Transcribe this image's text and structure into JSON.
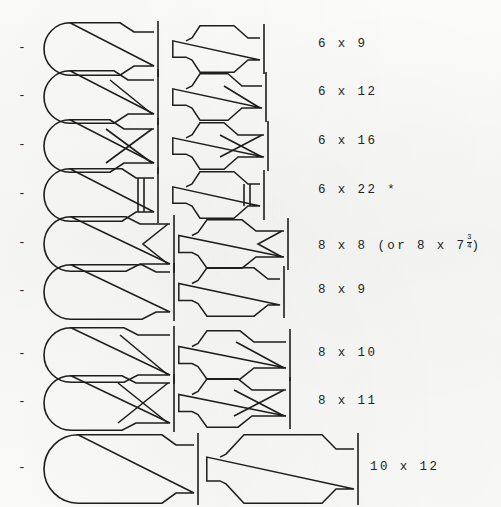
{
  "page": {
    "bullet_glyph": "-",
    "background_color": "#fbfbfa",
    "ink_color": "#1e1e1e"
  },
  "columns": {
    "bullet_label": "bullet",
    "profile_label": "large-profile",
    "section_label": "small-profile",
    "size_label": "size"
  },
  "rows": [
    {
      "id": "row-6x9",
      "bullet": "-",
      "size_text": "6 x 9",
      "size_has_fraction": false,
      "asterisk": false,
      "marking": "none",
      "stop_bars": 1,
      "y": 20,
      "label_x": 318,
      "label_y": 37,
      "large": {
        "x": 44,
        "w": 112,
        "h": 54,
        "body_w": 86,
        "round_r": 26,
        "tail_h": 34
      },
      "small": {
        "x": 172,
        "w": 90,
        "h": 48,
        "body_w": 72,
        "round_r": 20,
        "tail_h": 22
      }
    },
    {
      "id": "row-6x12",
      "bullet": "-",
      "size_text": "6 x 12",
      "size_has_fraction": false,
      "asterisk": false,
      "marking": "diagonal",
      "stop_bars": 1,
      "y": 68,
      "label_x": 318,
      "label_y": 85,
      "large": {
        "x": 44,
        "w": 112,
        "h": 54,
        "body_w": 80,
        "round_r": 26,
        "tail_h": 34
      },
      "small": {
        "x": 172,
        "w": 92,
        "h": 48,
        "body_w": 66,
        "round_r": 20,
        "tail_h": 22
      }
    },
    {
      "id": "row-6x16",
      "bullet": "-",
      "size_text": "6 x 16",
      "size_has_fraction": false,
      "asterisk": false,
      "marking": "cross",
      "stop_bars": 1,
      "y": 117,
      "label_x": 318,
      "label_y": 134,
      "large": {
        "x": 44,
        "w": 112,
        "h": 54,
        "body_w": 76,
        "round_r": 26,
        "tail_h": 34
      },
      "small": {
        "x": 172,
        "w": 94,
        "h": 48,
        "body_w": 62,
        "round_r": 20,
        "tail_h": 22
      }
    },
    {
      "id": "row-6x22",
      "bullet": "-",
      "size_text": "6 x 22 *",
      "size_has_fraction": false,
      "asterisk": true,
      "marking": "double-line",
      "stop_bars": 1,
      "y": 166,
      "label_x": 318,
      "label_y": 183,
      "large": {
        "x": 44,
        "w": 112,
        "h": 54,
        "body_w": 88,
        "round_r": 26,
        "tail_h": 34
      },
      "small": {
        "x": 172,
        "w": 90,
        "h": 48,
        "body_w": 72,
        "round_r": 20,
        "tail_h": 22
      }
    },
    {
      "id": "row-8x8",
      "bullet": "-",
      "size_text_prefix": "8 x 8  (or  8 x 7",
      "size_text_suffix": ")",
      "size_text": "8 x 8  (or  8 x 7¾)",
      "size_has_fraction": true,
      "fraction_numerator": "3",
      "fraction_denominator": "4",
      "asterisk": false,
      "marking": "chevron",
      "stop_bars": 1,
      "y": 214,
      "label_x": 318,
      "label_y": 235,
      "large": {
        "x": 44,
        "w": 128,
        "h": 56,
        "body_w": 92,
        "round_r": 27,
        "tail_h": 40
      },
      "small": {
        "x": 178,
        "w": 108,
        "h": 50,
        "body_w": 74,
        "round_r": 21,
        "tail_h": 26
      }
    },
    {
      "id": "row-8x9",
      "bullet": "-",
      "size_text": "8 x 9",
      "size_has_fraction": false,
      "asterisk": false,
      "marking": "none",
      "stop_bars": 1,
      "y": 262,
      "label_x": 318,
      "label_y": 283,
      "large": {
        "x": 44,
        "w": 128,
        "h": 56,
        "body_w": 108,
        "round_r": 27,
        "tail_h": 40
      },
      "small": {
        "x": 178,
        "w": 104,
        "h": 50,
        "body_w": 86,
        "round_r": 21,
        "tail_h": 26
      }
    },
    {
      "id": "row-8x10",
      "bullet": "-",
      "size_text": "8 x 10",
      "size_has_fraction": false,
      "asterisk": false,
      "marking": "diagonal",
      "stop_bars": 1,
      "y": 325,
      "label_x": 318,
      "label_y": 346,
      "large": {
        "x": 44,
        "w": 128,
        "h": 56,
        "body_w": 90,
        "round_r": 27,
        "tail_h": 40
      },
      "small": {
        "x": 178,
        "w": 110,
        "h": 50,
        "body_w": 72,
        "round_r": 21,
        "tail_h": 26
      }
    },
    {
      "id": "row-8x11",
      "bullet": "-",
      "size_text": "8 x 11",
      "size_has_fraction": false,
      "asterisk": false,
      "marking": "cross",
      "stop_bars": 1,
      "y": 373,
      "label_x": 318,
      "label_y": 394,
      "large": {
        "x": 44,
        "w": 128,
        "h": 56,
        "body_w": 88,
        "round_r": 27,
        "tail_h": 40
      },
      "small": {
        "x": 178,
        "w": 110,
        "h": 50,
        "body_w": 70,
        "round_r": 21,
        "tail_h": 26
      }
    },
    {
      "id": "row-10x12",
      "bullet": "-",
      "size_text": "10 x 12",
      "size_has_fraction": false,
      "asterisk": false,
      "marking": "none",
      "stop_bars": 1,
      "y": 432,
      "label_x": 370,
      "label_y": 460,
      "large": {
        "x": 44,
        "w": 152,
        "h": 70,
        "body_w": 128,
        "round_r": 34,
        "tail_h": 48
      },
      "small": {
        "x": 206,
        "w": 150,
        "h": 70,
        "body_w": 126,
        "round_r": 30,
        "tail_h": 40
      }
    }
  ]
}
